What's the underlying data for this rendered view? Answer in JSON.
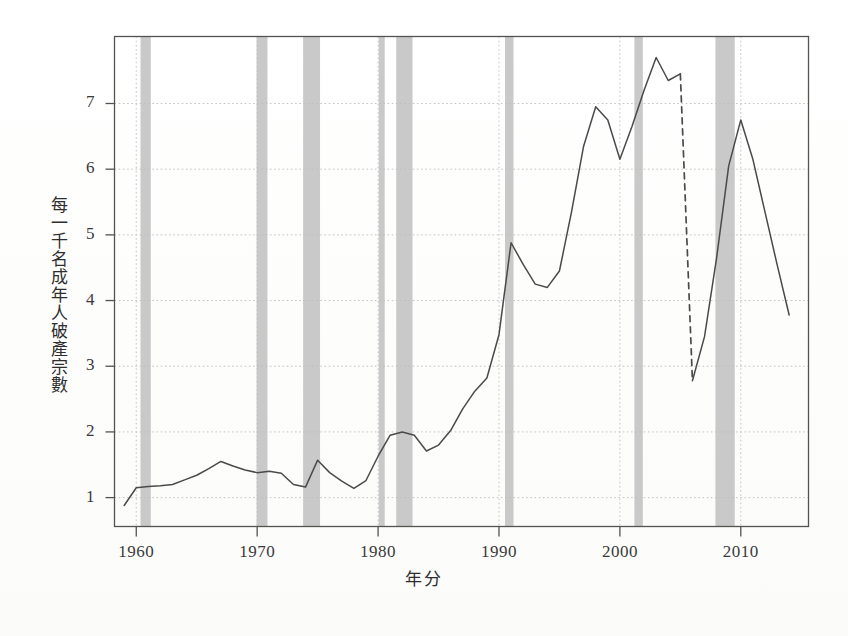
{
  "chart_data": {
    "type": "line",
    "title": "",
    "xlabel": "年分",
    "ylabel": "每一千名成年人破產宗數",
    "xlim": [
      1958.2,
      2015.6
    ],
    "ylim": [
      0.56,
      8.02
    ],
    "xticks": [
      1960,
      1970,
      1980,
      1990,
      2000,
      2010
    ],
    "xtick_labels": [
      "1960",
      "1970",
      "1980",
      "1990",
      "2000",
      "2010"
    ],
    "yticks": [
      1,
      2,
      3,
      4,
      5,
      6,
      7
    ],
    "ytick_labels": [
      "1",
      "2",
      "3",
      "4",
      "5",
      "6",
      "7"
    ],
    "grid": "dotted-both-axes",
    "legend": "none",
    "line_color": "#4a4a4a",
    "recession_band_color": "#c6c6c6",
    "axis_color": "#55524f",
    "grid_color": "#bdbdbd",
    "series": [
      {
        "name": "每一千名成年人破產宗數",
        "style": "solid",
        "x": [
          1959,
          1960,
          1961,
          1962,
          1963,
          1964,
          1965,
          1966,
          1967,
          1968,
          1969,
          1970,
          1971,
          1972,
          1973,
          1974,
          1975,
          1976,
          1977,
          1978,
          1979,
          1980,
          1981,
          1982,
          1983,
          1984,
          1985,
          1986,
          1987,
          1988,
          1989,
          1990,
          1991,
          1992,
          1993,
          1994,
          1995,
          1996,
          1997,
          1998,
          1999,
          2000,
          2001,
          2002,
          2003,
          2004,
          2005
        ],
        "y": [
          0.88,
          1.15,
          1.17,
          1.18,
          1.2,
          1.27,
          1.34,
          1.44,
          1.55,
          1.48,
          1.42,
          1.38,
          1.4,
          1.37,
          1.2,
          1.16,
          1.57,
          1.38,
          1.25,
          1.14,
          1.26,
          1.63,
          1.95,
          2.0,
          1.95,
          1.71,
          1.8,
          2.02,
          2.35,
          2.62,
          2.82,
          3.48,
          4.88,
          4.55,
          4.25,
          4.2,
          4.45,
          5.35,
          6.35,
          6.95,
          6.75,
          6.15,
          6.65,
          7.2,
          7.7,
          7.35,
          7.45
        ]
      },
      {
        "name": "2005年破產法修訂後斷層",
        "style": "dashed",
        "x": [
          2005,
          2006
        ],
        "y": [
          7.45,
          2.78
        ]
      },
      {
        "name": "每一千名成年人破產宗數（續）",
        "style": "solid",
        "x": [
          2006,
          2007,
          2008,
          2009,
          2010,
          2011,
          2012,
          2013,
          2014
        ],
        "y": [
          2.78,
          3.45,
          4.65,
          6.05,
          6.75,
          6.15,
          5.35,
          4.55,
          3.78
        ]
      }
    ],
    "recession_bands": [
      {
        "start": 1960.35,
        "end": 1961.2
      },
      {
        "start": 1969.95,
        "end": 1970.85
      },
      {
        "start": 1973.8,
        "end": 1975.2
      },
      {
        "start": 1980.05,
        "end": 1980.55
      },
      {
        "start": 1981.5,
        "end": 1982.85
      },
      {
        "start": 1990.5,
        "end": 1991.2
      },
      {
        "start": 2001.2,
        "end": 2001.9
      },
      {
        "start": 2007.9,
        "end": 2009.5
      }
    ]
  }
}
